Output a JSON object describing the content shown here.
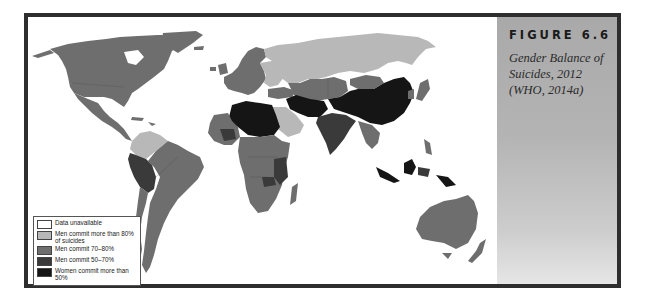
{
  "figure": {
    "label": "FIGURE 6.6",
    "caption": "Gender Balance of Suicides, 2012 (WHO, 2014a)"
  },
  "legend": {
    "items": [
      {
        "label": "Data unavailable",
        "color": "#ffffff"
      },
      {
        "label": "Men commit more than 80% of suicides",
        "color": "#b8b8b8"
      },
      {
        "label": "Men commit 70–80%",
        "color": "#6e6e6e"
      },
      {
        "label": "Men commit 50–70%",
        "color": "#3a3a3a"
      },
      {
        "label": "Women commit more than 50%",
        "color": "#151515"
      }
    ]
  },
  "colors": {
    "frame_border": "#2e2e2e",
    "panel_top": "#a9a9a9",
    "panel_bottom": "#e6e6e6",
    "ocean": "#ffffff"
  },
  "map": {
    "type": "choropleth",
    "title": "Gender Balance of Suicides, 2012",
    "regions": [
      {
        "name": "North America (USA, Canada)",
        "category": "Men commit 70–80%"
      },
      {
        "name": "Greenland",
        "category": "Men commit 70–80%"
      },
      {
        "name": "Mexico & Central America",
        "category": "Men commit 70–80%"
      },
      {
        "name": "Colombia / Venezuela",
        "category": "Men commit more than 80% of suicides"
      },
      {
        "name": "Peru / Bolivia",
        "category": "Men commit 50–70%"
      },
      {
        "name": "Brazil / Southern South America",
        "category": "Men commit 70–80%"
      },
      {
        "name": "Russia",
        "category": "Men commit more than 80% of suicides"
      },
      {
        "name": "Eastern Europe",
        "category": "Men commit more than 80% of suicides"
      },
      {
        "name": "Western Europe",
        "category": "Men commit 70–80%"
      },
      {
        "name": "North Africa (Sahara)",
        "category": "Women commit more than 50%"
      },
      {
        "name": "Sub-Saharan Africa",
        "category": "Men commit 70–80%"
      },
      {
        "name": "Saudi Arabia",
        "category": "Men commit more than 80% of suicides"
      },
      {
        "name": "Central Asia (Kazakhstan)",
        "category": "Men commit 70–80%"
      },
      {
        "name": "Iraq / Iran / Afghanistan",
        "category": "Women commit more than 50%"
      },
      {
        "name": "China",
        "category": "Women commit more than 50%"
      },
      {
        "name": "India",
        "category": "Men commit 50–70%"
      },
      {
        "name": "Mongolia",
        "category": "Men commit 70–80%"
      },
      {
        "name": "Southeast Asia",
        "category": "Men commit 70–80%"
      },
      {
        "name": "Indonesia / Papua",
        "category": "Women commit more than 50%"
      },
      {
        "name": "Australia / New Zealand",
        "category": "Men commit 70–80%"
      }
    ]
  }
}
